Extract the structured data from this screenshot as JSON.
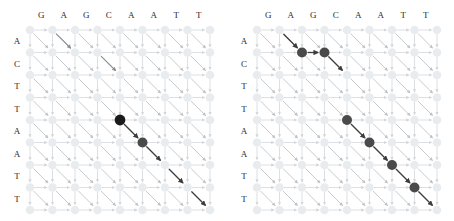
{
  "figure": {
    "panel_count": 2,
    "colors": {
      "faint_node": "#e9ecef",
      "faint_edge": "#dcdfe3",
      "mid_edge": "#c6cacd",
      "dark_edge": "#3d3d3d",
      "dark_node": "#4a4a4a",
      "black_node": "#1a1a1a",
      "label_text": "#2b2b2b",
      "background": "#ffffff"
    },
    "grid": {
      "columns": 9,
      "rows": 9,
      "cell_size": 22.5,
      "origin_x": 30,
      "origin_y": 30
    }
  },
  "panels": [
    {
      "id": "left-panel",
      "name": "left-alignment-grid",
      "column_labels": [
        "G",
        "A",
        "G",
        "C",
        "A",
        "A",
        "T",
        "T"
      ],
      "row_labels": [
        "A",
        "C",
        "T",
        "T",
        "A",
        "A",
        "T",
        "T"
      ],
      "highlighted_nodes": [
        {
          "col": 4,
          "row": 4,
          "style": "black"
        },
        {
          "col": 5,
          "row": 5,
          "style": "dark"
        }
      ],
      "highlighted_edges": [
        {
          "from": [
            4,
            4
          ],
          "to": [
            5,
            5
          ],
          "weight": "dark"
        },
        {
          "from": [
            5,
            5
          ],
          "to": [
            6,
            6
          ],
          "weight": "dark"
        },
        {
          "from": [
            6,
            6
          ],
          "to": [
            7,
            7
          ],
          "weight": "dark"
        },
        {
          "from": [
            7,
            7
          ],
          "to": [
            8,
            8
          ],
          "weight": "dark"
        },
        {
          "from": [
            1,
            0
          ],
          "to": [
            2,
            1
          ],
          "weight": "semidark"
        },
        {
          "from": [
            3,
            1
          ],
          "to": [
            4,
            2
          ],
          "weight": "semidark"
        }
      ]
    },
    {
      "id": "right-panel",
      "name": "right-alignment-grid",
      "column_labels": [
        "G",
        "A",
        "G",
        "C",
        "A",
        "A",
        "T",
        "T"
      ],
      "row_labels": [
        "A",
        "C",
        "T",
        "T",
        "A",
        "A",
        "T",
        "T"
      ],
      "highlighted_nodes": [
        {
          "col": 2,
          "row": 1,
          "style": "dark"
        },
        {
          "col": 3,
          "row": 1,
          "style": "dark"
        },
        {
          "col": 4,
          "row": 4,
          "style": "dark"
        },
        {
          "col": 5,
          "row": 5,
          "style": "dark"
        },
        {
          "col": 6,
          "row": 6,
          "style": "dark"
        },
        {
          "col": 7,
          "row": 7,
          "style": "dark"
        }
      ],
      "highlighted_edges": [
        {
          "from": [
            1,
            0
          ],
          "to": [
            2,
            1
          ],
          "weight": "dark"
        },
        {
          "from": [
            2,
            1
          ],
          "to": [
            3,
            1
          ],
          "weight": "dark"
        },
        {
          "from": [
            3,
            1
          ],
          "to": [
            4,
            2
          ],
          "weight": "dark"
        },
        {
          "from": [
            4,
            4
          ],
          "to": [
            5,
            5
          ],
          "weight": "dark"
        },
        {
          "from": [
            5,
            5
          ],
          "to": [
            6,
            6
          ],
          "weight": "dark"
        },
        {
          "from": [
            6,
            6
          ],
          "to": [
            7,
            7
          ],
          "weight": "dark"
        },
        {
          "from": [
            7,
            7
          ],
          "to": [
            8,
            8
          ],
          "weight": "dark"
        }
      ]
    }
  ]
}
